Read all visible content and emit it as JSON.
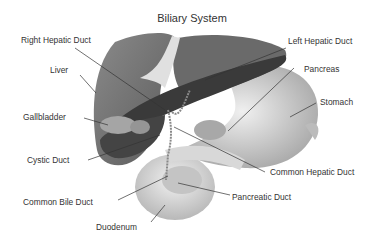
{
  "title": "Biliary System",
  "labels": {
    "right_hepatic_duct": "Right Hepatic Duct",
    "left_hepatic_duct": "Left Hepatic Duct",
    "liver": "Liver",
    "pancreas": "Pancreas",
    "stomach": "Stomach",
    "gallbladder": "Gallbladder",
    "cystic_duct": "Cystic Duct",
    "common_hepatic_duct": "Common Hepatic Duct",
    "pancreatic_duct": "Pancreatic Duct",
    "common_bile_duct": "Common Bile Duct",
    "duodenum": "Duodenum"
  },
  "colors": {
    "liver_light": "#7a7a7a",
    "liver_dark": "#3a3a3a",
    "stomach": "#c8c8c8",
    "duodenum": "#d0d0d0",
    "gallbladder": "#9a9a9a",
    "leader_line": "#333333"
  }
}
